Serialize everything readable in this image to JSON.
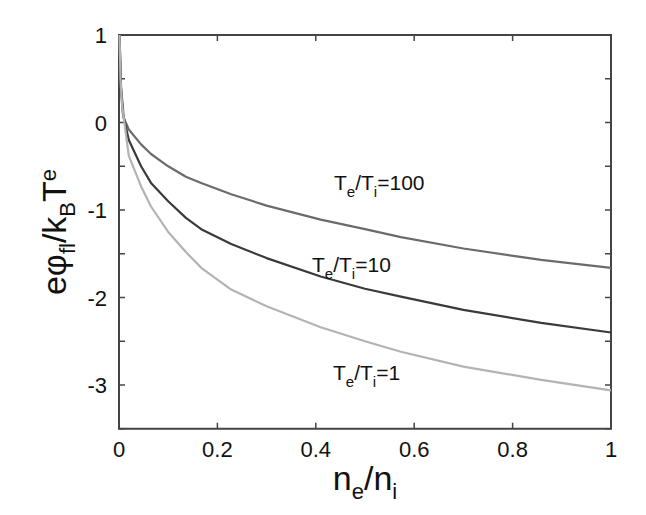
{
  "chart_data": {
    "type": "line",
    "title": "",
    "xlabel": "n_e/n_i",
    "ylabel": "eφ_fl/k_B T_e",
    "xlim": [
      0,
      1
    ],
    "ylim": [
      -3.5,
      1
    ],
    "grid": false,
    "legend": "inline labels",
    "xticks": [
      0,
      0.2,
      0.4,
      0.6,
      0.8,
      1
    ],
    "xtick_labels": [
      "0",
      "0.2",
      "0.4",
      "0.6",
      "0.8",
      "1"
    ],
    "yticks": [
      1,
      0,
      -1,
      -2,
      -3
    ],
    "ytick_labels": [
      "1",
      "0",
      "-1",
      "-2",
      "-3"
    ],
    "series": [
      {
        "name": "Te/Ti=100",
        "label_main": "T",
        "label_sub1": "e",
        "label_mid": "/T",
        "label_sub2": "i",
        "label_tail": "=100",
        "color": "#6b6b6b",
        "x": [
          0.001,
          0.004,
          0.01,
          0.02,
          0.045,
          0.065,
          0.1,
          0.136,
          0.167,
          0.228,
          0.3,
          0.41,
          0.5,
          0.573,
          0.7,
          0.858,
          1.0
        ],
        "y": [
          1.0,
          0.4,
          0.05,
          -0.08,
          -0.25,
          -0.36,
          -0.5,
          -0.62,
          -0.69,
          -0.82,
          -0.95,
          -1.11,
          -1.22,
          -1.31,
          -1.44,
          -1.57,
          -1.66
        ]
      },
      {
        "name": "Te/Ti=10",
        "label_main": "T",
        "label_sub1": "e",
        "label_mid": "/T",
        "label_sub2": "i",
        "label_tail": "=10",
        "color": "#3a3a3a",
        "x": [
          0.001,
          0.004,
          0.008,
          0.02,
          0.045,
          0.065,
          0.1,
          0.136,
          0.167,
          0.228,
          0.3,
          0.41,
          0.5,
          0.573,
          0.7,
          0.858,
          1.0
        ],
        "y": [
          1.0,
          0.4,
          0.1,
          -0.2,
          -0.5,
          -0.69,
          -0.9,
          -1.09,
          -1.22,
          -1.39,
          -1.55,
          -1.76,
          -1.9,
          -1.99,
          -2.14,
          -2.29,
          -2.4
        ]
      },
      {
        "name": "Te/Ti=1",
        "label_main": "T",
        "label_sub1": "e",
        "label_mid": "/T",
        "label_sub2": "i",
        "label_tail": "=1",
        "color": "#b3b3b3",
        "x": [
          0.001,
          0.003,
          0.006,
          0.02,
          0.045,
          0.065,
          0.1,
          0.136,
          0.167,
          0.228,
          0.3,
          0.41,
          0.5,
          0.573,
          0.7,
          0.858,
          1.0
        ],
        "y": [
          1.0,
          0.5,
          0.2,
          -0.38,
          -0.73,
          -0.96,
          -1.25,
          -1.48,
          -1.66,
          -1.91,
          -2.1,
          -2.34,
          -2.5,
          -2.62,
          -2.79,
          -2.94,
          -3.06
        ]
      }
    ]
  },
  "axes": {
    "ylabel_parts": {
      "e": "e",
      "phi": "φ",
      "fl": "fl",
      "slash_k": "/k",
      "B": "B",
      "T": "T",
      "e_sub": "e"
    },
    "xlabel_parts": {
      "n1": "n",
      "e": "e",
      "slash_n": "/n",
      "i": "i"
    }
  }
}
